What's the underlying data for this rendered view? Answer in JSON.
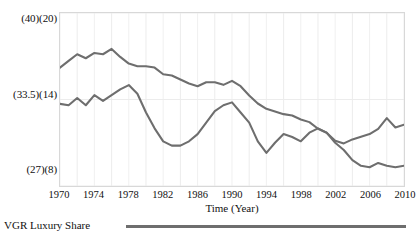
{
  "chart_data": {
    "type": "line",
    "title": "",
    "xlabel": "Time (Year)",
    "ylabel": "",
    "grid": true,
    "legend_position": "bottom-left",
    "xlim": [
      1970,
      2010
    ],
    "x_tick_labels": [
      "1970",
      "1974",
      "1978",
      "1982",
      "1986",
      "1990",
      "1994",
      "1998",
      "2002",
      "2006",
      "2010"
    ],
    "x_ticks": [
      1970,
      1974,
      1978,
      1982,
      1986,
      1990,
      1994,
      1998,
      2002,
      2006,
      2010
    ],
    "y_tick_labels": [
      "(40)(20)",
      "(33.5)(14)",
      "(27)(8)"
    ],
    "y_axis_primary": {
      "label": "",
      "ticks": [
        27,
        33.5,
        40
      ],
      "ylim": [
        27,
        40
      ]
    },
    "y_axis_secondary": {
      "label": "",
      "ticks": [
        8,
        14,
        20
      ],
      "ylim": [
        8,
        20
      ]
    },
    "line_color": "#6e6e6e",
    "x": [
      1970,
      1971,
      1972,
      1973,
      1974,
      1975,
      1976,
      1977,
      1978,
      1979,
      1980,
      1981,
      1982,
      1983,
      1984,
      1985,
      1986,
      1987,
      1988,
      1989,
      1990,
      1991,
      1992,
      1993,
      1994,
      1995,
      1996,
      1997,
      1998,
      1999,
      2000,
      2001,
      2002,
      2003,
      2004,
      2005,
      2006,
      2007,
      2008,
      2009,
      2010
    ],
    "series": [
      {
        "name": "VGR Luxury Share",
        "axis": "primary",
        "values": [
          35.9,
          36.4,
          36.9,
          36.6,
          37.0,
          36.9,
          37.3,
          36.7,
          36.2,
          36.0,
          36.0,
          35.9,
          35.4,
          35.3,
          35.0,
          34.7,
          34.5,
          34.8,
          34.8,
          34.6,
          34.9,
          34.5,
          33.8,
          33.2,
          32.8,
          32.6,
          32.4,
          32.3,
          32.0,
          31.8,
          31.3,
          31.0,
          30.4,
          30.2,
          30.5,
          30.7,
          30.9,
          31.3,
          32.1,
          31.4,
          31.6
        ]
      },
      {
        "name": "VGR Luxury Share",
        "axis": "secondary",
        "values": [
          13.7,
          13.6,
          14.1,
          13.6,
          14.3,
          13.9,
          14.3,
          14.7,
          15.0,
          14.4,
          13.1,
          12.0,
          11.1,
          10.8,
          10.8,
          11.1,
          11.6,
          12.4,
          13.2,
          13.6,
          13.8,
          13.1,
          12.4,
          11.1,
          10.3,
          11.0,
          11.6,
          11.4,
          11.1,
          11.7,
          12.0,
          11.7,
          11.0,
          10.5,
          9.8,
          9.4,
          9.3,
          9.6,
          9.4,
          9.3,
          9.4
        ]
      }
    ]
  },
  "axis": {
    "x_title": "Time (Year)"
  },
  "y_labels": {
    "top": "(40)(20)",
    "middle": "(33.5)(14)",
    "bottom": "(27)(8)"
  },
  "x_labels": {
    "t0": "1970",
    "t1": "1974",
    "t2": "1978",
    "t3": "1982",
    "t4": "1986",
    "t5": "1990",
    "t6": "1994",
    "t7": "1998",
    "t8": "2002",
    "t9": "2006",
    "t10": "2010"
  },
  "legend": {
    "label": "VGR Luxury Share"
  },
  "colors": {
    "line": "#6e6e6e",
    "grid": "#ececec",
    "frame": "#d8d8d8"
  }
}
